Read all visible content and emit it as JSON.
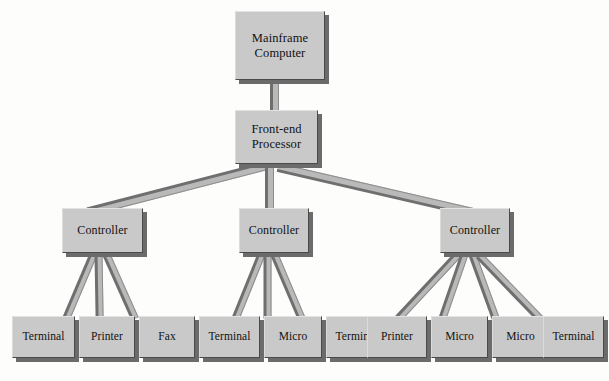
{
  "diagram": {
    "background_color": "#fdfdfc",
    "node_fill_color": "#c9c9c9",
    "node_border_color": "#4a4a4a",
    "shadow_color": "#6b6b6b",
    "connector_color": "#b9b9b9",
    "levels": 4
  },
  "nodes": {
    "mainframe": {
      "line1": "Mainframe",
      "line2": "Computer"
    },
    "frontend": {
      "line1": "Front-end",
      "line2": "Processor"
    },
    "controllers": [
      {
        "label": "Controller"
      },
      {
        "label": "Controller"
      },
      {
        "label": "Controller"
      }
    ],
    "devices": [
      {
        "label": "Terminal"
      },
      {
        "label": "Printer"
      },
      {
        "label": "Fax"
      },
      {
        "label": "Terminal"
      },
      {
        "label": "Micro"
      },
      {
        "label": "Terminal"
      },
      {
        "label": "Printer"
      },
      {
        "label": "Micro"
      },
      {
        "label": "Micro"
      },
      {
        "label": "Terminal"
      }
    ]
  }
}
